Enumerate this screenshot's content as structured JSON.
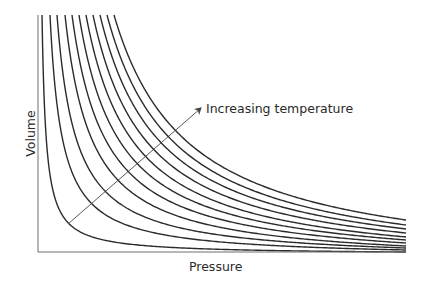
{
  "chart_data": {
    "type": "line",
    "title": "",
    "xlabel": "Pressure",
    "ylabel": "Volume",
    "annotations": [
      {
        "text": "Increasing temperature",
        "arrow": {
          "from": [
            68,
            224
          ],
          "to": [
            201,
            108
          ]
        }
      }
    ],
    "grid": false,
    "legend": null,
    "axis_ticks": "none",
    "series": [
      {
        "name": "isotherm-1",
        "x_top_px": 42,
        "y_end_px": 252
      },
      {
        "name": "isotherm-2",
        "x_top_px": 50,
        "y_end_px": 250
      },
      {
        "name": "isotherm-3",
        "x_top_px": 57,
        "y_end_px": 248
      },
      {
        "name": "isotherm-4",
        "x_top_px": 65,
        "y_end_px": 246
      },
      {
        "name": "isotherm-5",
        "x_top_px": 72,
        "y_end_px": 243
      },
      {
        "name": "isotherm-6",
        "x_top_px": 79,
        "y_end_px": 240
      },
      {
        "name": "isotherm-7",
        "x_top_px": 86,
        "y_end_px": 237
      },
      {
        "name": "isotherm-8",
        "x_top_px": 93,
        "y_end_px": 233
      },
      {
        "name": "isotherm-9",
        "x_top_px": 100,
        "y_end_px": 229
      },
      {
        "name": "isotherm-10",
        "x_top_px": 107,
        "y_end_px": 225
      },
      {
        "name": "isotherm-11",
        "x_top_px": 114,
        "y_end_px": 220
      }
    ],
    "plot_area_px": {
      "x0": 38,
      "y_top": 15,
      "x1": 406,
      "y_axis": 252
    },
    "colors": {
      "curve": "#2b2b2b",
      "axis": "#6e6e6e",
      "arrow": "#444444"
    }
  }
}
